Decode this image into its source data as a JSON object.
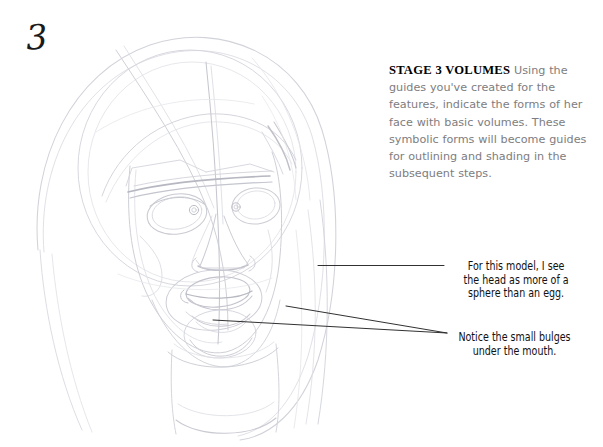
{
  "page": {
    "background_color": "#ffffff",
    "width": 603,
    "height": 447
  },
  "stage": {
    "number": "3"
  },
  "instruction": {
    "heading": "STAGE 3  VOLUMES",
    "body": " Using the guides you've created for the features, indicate the forms of her face with basic volumes. These symbolic forms will become guides for outlining and shading in the subsequent steps.",
    "heading_color": "#000000",
    "body_color": "#7d7d80"
  },
  "annotations": [
    {
      "id": "sphere-note",
      "text": "For this model, I see\nthe head as more of a\nsphere than an egg.",
      "color": "#111111",
      "leader": "horizontal-line"
    },
    {
      "id": "bulges-note",
      "text": "Notice the small bulges\nunder the mouth.",
      "color": "#111111",
      "leader": "two-converging-lines"
    }
  ],
  "drawing": {
    "subject": "pencil-sketch-womans-head-volumes",
    "medium": "graphite pencil",
    "line_color": "#c9c9cf",
    "dark_line_color": "#a8a8b0"
  },
  "leader_lines": {
    "color": "#232323",
    "width": 0.9
  }
}
